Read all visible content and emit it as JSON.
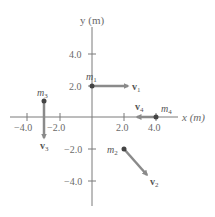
{
  "axes": {
    "x_label": "x (m)",
    "y_label": "y (m)",
    "x_ticks": [
      "−4.0",
      "−2.0",
      "2.0",
      "4.0"
    ],
    "y_ticks": [
      "4.0",
      "2.0",
      "−2.0",
      "−4.0"
    ]
  },
  "masses": [
    {
      "id": "m1",
      "label": "m",
      "sub": "1",
      "x": 0,
      "y": 2,
      "velocity_label": "v",
      "velocity_sub": "1",
      "direction": "+x"
    },
    {
      "id": "m2",
      "label": "m",
      "sub": "2",
      "x": 2,
      "y": -2,
      "velocity_label": "v",
      "velocity_sub": "2",
      "direction": "down-right"
    },
    {
      "id": "m3",
      "label": "m",
      "sub": "3",
      "x": -3,
      "y": 1,
      "velocity_label": "v",
      "velocity_sub": "3",
      "direction": "-y"
    },
    {
      "id": "m4",
      "label": "m",
      "sub": "4",
      "x": 4,
      "y": 0,
      "velocity_label": "v",
      "velocity_sub": "4",
      "direction": "-x"
    }
  ],
  "colors": {
    "axis": "#7a7a7a",
    "arrow": "#8a8a8a",
    "point": "#444444",
    "text": "#6a6a6a"
  }
}
